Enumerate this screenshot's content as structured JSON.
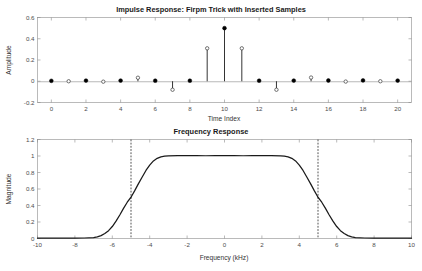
{
  "figure": {
    "background": "#ffffff",
    "axis_color": "#8c8c8c",
    "curve_color": "#1a1a1a",
    "marker_color": "#000000"
  },
  "charts": {
    "impulse": {
      "title": "Impulse Response: Firpm Trick with Inserted Samples",
      "xlabel": "Time Index",
      "ylabel": "Amplitude",
      "xticks": [
        "0",
        "2",
        "4",
        "6",
        "8",
        "10",
        "12",
        "14",
        "16",
        "18",
        "20"
      ],
      "yticks": [
        "0.6",
        "0.4",
        "0.2",
        "0",
        "-0.2"
      ]
    },
    "freq": {
      "title": "Frequency Response",
      "xlabel": "Frequency (kHz)",
      "ylabel": "Magnitude",
      "xticks": [
        "-10",
        "-8",
        "-6",
        "-4",
        "-2",
        "0",
        "2",
        "4",
        "6",
        "8",
        "10"
      ],
      "yticks": [
        "1.2",
        "1",
        "0.8",
        "0.6",
        "0.4",
        "0.2",
        "0"
      ]
    }
  },
  "chart_data": [
    {
      "type": "bar",
      "subtype": "stem",
      "title": "Impulse Response: Firpm Trick with Inserted Samples",
      "xlabel": "Time Index",
      "ylabel": "Amplitude",
      "xlim": [
        -0.8,
        20.8
      ],
      "ylim": [
        -0.2,
        0.6
      ],
      "xticks": [
        0,
        2,
        4,
        6,
        8,
        10,
        12,
        14,
        16,
        18,
        20
      ],
      "yticks": [
        -0.2,
        0,
        0.2,
        0.4,
        0.6
      ],
      "grid": false,
      "legend": null,
      "categories": [
        0,
        1,
        2,
        3,
        4,
        5,
        6,
        7,
        8,
        9,
        10,
        11,
        12,
        13,
        14,
        15,
        16,
        17,
        18,
        19,
        20
      ],
      "values": [
        0.004,
        0.0,
        0.006,
        -0.004,
        0.006,
        0.033,
        0.005,
        -0.08,
        0.005,
        0.31,
        0.5,
        0.31,
        0.005,
        -0.08,
        0.006,
        0.035,
        0.007,
        -0.003,
        0.008,
        0.0,
        0.006
      ],
      "marker_styles": [
        "filled",
        "open",
        "filled",
        "open",
        "filled",
        "open",
        "filled",
        "open",
        "filled",
        "open",
        "filled",
        "open",
        "filled",
        "open",
        "filled",
        "open",
        "filled",
        "open",
        "filled",
        "open",
        "filled"
      ],
      "annotations": [
        "Odd-index samples are inserted (open markers)"
      ]
    },
    {
      "type": "line",
      "title": "Frequency Response",
      "xlabel": "Frequency (kHz)",
      "ylabel": "Magnitude",
      "xlim": [
        -10,
        10
      ],
      "ylim": [
        0,
        1.2
      ],
      "xticks": [
        -10,
        -8,
        -6,
        -4,
        -2,
        0,
        2,
        4,
        6,
        8,
        10
      ],
      "yticks": [
        0,
        0.2,
        0.4,
        0.6,
        0.8,
        1,
        1.2
      ],
      "grid": false,
      "legend": null,
      "vertical_markers": [
        {
          "x": -5,
          "style": "dashed",
          "label": "cutoff"
        },
        {
          "x": 5,
          "style": "dashed",
          "label": "cutoff"
        }
      ],
      "series": [
        {
          "name": "Magnitude",
          "x": [
            -10,
            -9.5,
            -9,
            -8.5,
            -8,
            -7.5,
            -7,
            -6.8,
            -6.6,
            -6.4,
            -6.2,
            -6,
            -5.8,
            -5.6,
            -5.4,
            -5.2,
            -5,
            -4.8,
            -4.6,
            -4.4,
            -4.2,
            -4,
            -3.8,
            -3.6,
            -3.4,
            -3.2,
            -3,
            -2.5,
            -2,
            -1.5,
            -1,
            -0.5,
            0,
            0.5,
            1,
            1.5,
            2,
            2.5,
            3,
            3.2,
            3.4,
            3.6,
            3.8,
            4,
            4.2,
            4.4,
            4.6,
            4.8,
            5,
            5.2,
            5.4,
            5.6,
            5.8,
            6,
            6.2,
            6.4,
            6.6,
            6.8,
            7,
            7.5,
            8,
            8.5,
            9,
            9.5,
            10
          ],
          "y": [
            0.004,
            0.004,
            0.004,
            0.004,
            0.005,
            0.006,
            0.012,
            0.02,
            0.035,
            0.06,
            0.095,
            0.145,
            0.21,
            0.285,
            0.365,
            0.44,
            0.5,
            0.58,
            0.665,
            0.745,
            0.825,
            0.89,
            0.94,
            0.972,
            0.99,
            0.998,
            1.002,
            1.004,
            1.005,
            1.004,
            1.003,
            1.004,
            1.005,
            1.004,
            1.003,
            1.004,
            1.005,
            1.004,
            1.002,
            0.998,
            0.99,
            0.972,
            0.94,
            0.89,
            0.825,
            0.745,
            0.665,
            0.58,
            0.5,
            0.44,
            0.365,
            0.285,
            0.21,
            0.145,
            0.095,
            0.06,
            0.035,
            0.02,
            0.012,
            0.006,
            0.005,
            0.004,
            0.004,
            0.004,
            0.004
          ]
        }
      ]
    }
  ]
}
